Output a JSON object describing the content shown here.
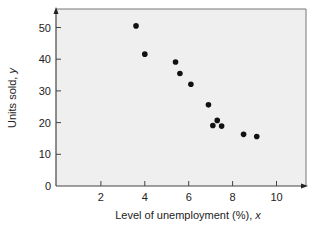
{
  "chart_data": {
    "type": "scatter",
    "title": "",
    "xlabel": "Level of unemployment (%), ",
    "xlabel_var": "x",
    "ylabel": "Units sold, ",
    "ylabel_var": "y",
    "xlim": [
      0,
      11.4
    ],
    "ylim": [
      0,
      56
    ],
    "x_ticks": [
      2,
      4,
      6,
      8,
      10
    ],
    "y_ticks": [
      0,
      10,
      20,
      30,
      40,
      50
    ],
    "grid": false,
    "legend": null,
    "series": [
      {
        "name": "observations",
        "color": "#111111",
        "points": [
          {
            "x": 3.6,
            "y": 50.5
          },
          {
            "x": 4.0,
            "y": 41.6
          },
          {
            "x": 5.4,
            "y": 39.1
          },
          {
            "x": 5.6,
            "y": 35.5
          },
          {
            "x": 6.1,
            "y": 32.1
          },
          {
            "x": 6.9,
            "y": 25.6
          },
          {
            "x": 7.1,
            "y": 19.1
          },
          {
            "x": 7.3,
            "y": 20.7
          },
          {
            "x": 7.5,
            "y": 18.9
          },
          {
            "x": 8.5,
            "y": 16.3
          },
          {
            "x": 9.1,
            "y": 15.6
          }
        ]
      }
    ]
  },
  "colors": {
    "plot_background": "#efefef",
    "axis": "#444444",
    "frame": "#666666",
    "marker": "#111111"
  }
}
